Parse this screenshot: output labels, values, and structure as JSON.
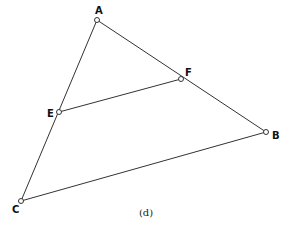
{
  "figure": {
    "caption": "(d)",
    "caption_pos": [
      146,
      216
    ],
    "points": [
      {
        "id": "A",
        "label": "A",
        "x": 97,
        "y": 20,
        "label_x": 95,
        "label_y": 14
      },
      {
        "id": "F",
        "label": "F",
        "x": 181,
        "y": 79,
        "label_x": 185,
        "label_y": 76
      },
      {
        "id": "E",
        "label": "E",
        "x": 59,
        "y": 112,
        "label_x": 47,
        "label_y": 117
      },
      {
        "id": "B",
        "label": "B",
        "x": 266,
        "y": 132,
        "label_x": 272,
        "label_y": 139
      },
      {
        "id": "C",
        "label": "C",
        "x": 21,
        "y": 201,
        "label_x": 12,
        "label_y": 213
      }
    ],
    "segments": [
      {
        "from": "A",
        "to": "C"
      },
      {
        "from": "A",
        "to": "B"
      },
      {
        "from": "C",
        "to": "B"
      },
      {
        "from": "E",
        "to": "F"
      }
    ],
    "stroke_color": "#333333"
  }
}
